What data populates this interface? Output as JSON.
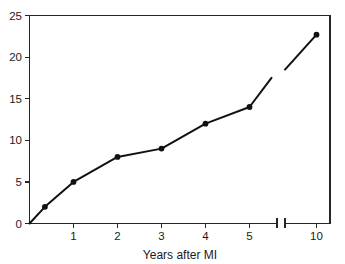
{
  "chart_data": {
    "type": "line",
    "title": "",
    "xlabel": "Years after MI",
    "ylabel": "",
    "xlim": [
      0,
      10.5
    ],
    "ylim": [
      0,
      25
    ],
    "grid": false,
    "legend": null,
    "axis_break": {
      "present": true,
      "after": 5.5,
      "resume": 9.4,
      "orientation": "x"
    },
    "x_ticks": [
      "1",
      "2",
      "3",
      "4",
      "5",
      "10"
    ],
    "x_tick_values": [
      1,
      2,
      3,
      4,
      5,
      10
    ],
    "y_ticks": [
      "0",
      "5",
      "10",
      "15",
      "20",
      "25"
    ],
    "y_tick_values": [
      0,
      5,
      10,
      15,
      20,
      25
    ],
    "series": [
      {
        "name": "cumulative-incidence",
        "marker": "filled-circle",
        "color": "#111111",
        "x": [
          0,
          0.35,
          1,
          2,
          3,
          4,
          5,
          5.5
        ],
        "y": [
          0,
          2,
          5,
          8,
          9,
          12,
          14,
          17.5
        ],
        "x_after_break": [
          5.7,
          10
        ],
        "y_after_break": [
          18.5,
          22.7
        ]
      }
    ],
    "points": [
      {
        "x": 0,
        "y": 0,
        "marker": false
      },
      {
        "x": 0.35,
        "y": 2,
        "marker": true
      },
      {
        "x": 1,
        "y": 5,
        "marker": true
      },
      {
        "x": 2,
        "y": 8,
        "marker": true
      },
      {
        "x": 3,
        "y": 9,
        "marker": true
      },
      {
        "x": 4,
        "y": 12,
        "marker": true
      },
      {
        "x": 5,
        "y": 14,
        "marker": true
      },
      {
        "x": 5.5,
        "y": 17.5,
        "marker": false
      },
      {
        "x": 9.6,
        "y": 18.5,
        "marker": false
      },
      {
        "x": 10,
        "y": 22.7,
        "marker": true
      }
    ]
  },
  "axes": {
    "x_title": "Years after MI",
    "y_tick_0": "0",
    "y_tick_5": "5",
    "y_tick_10": "10",
    "y_tick_15": "15",
    "y_tick_20": "20",
    "y_tick_25": "25",
    "x_tick_1": "1",
    "x_tick_2": "2",
    "x_tick_3": "3",
    "x_tick_4": "4",
    "x_tick_5": "5",
    "x_tick_10": "10"
  }
}
